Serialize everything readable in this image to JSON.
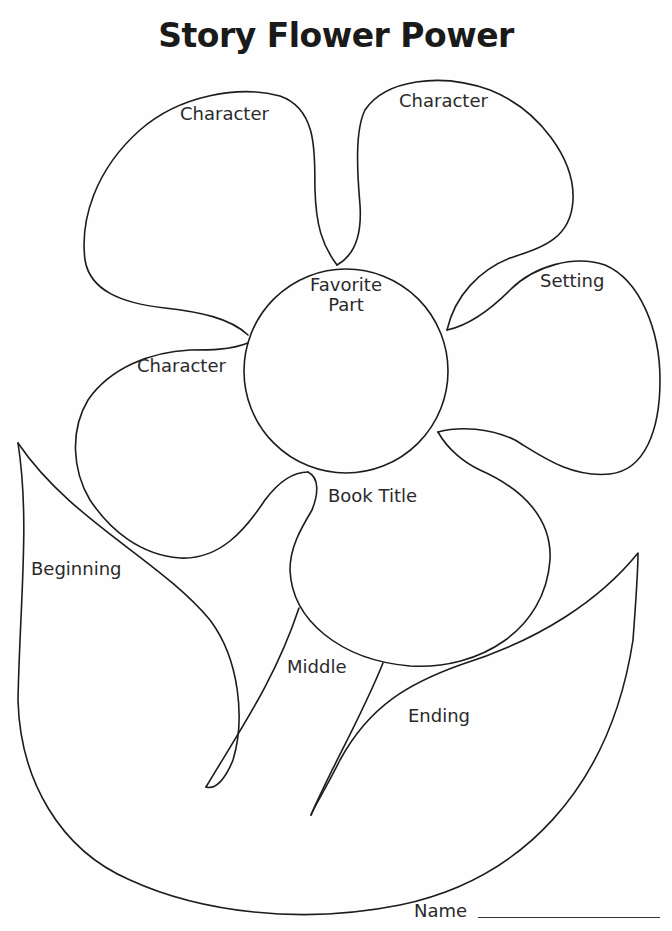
{
  "title": "Story Flower Power",
  "flower": {
    "center": {
      "label_line1": "Favorite",
      "label_line2": "Part"
    },
    "petals": [
      {
        "id": "petal-top-left",
        "label": "Character"
      },
      {
        "id": "petal-top-right",
        "label": "Character"
      },
      {
        "id": "petal-right",
        "label": "Setting"
      },
      {
        "id": "petal-left",
        "label": "Character"
      },
      {
        "id": "petal-bottom",
        "label": "Book Title"
      }
    ],
    "leaves": [
      {
        "id": "leaf-left",
        "label": "Beginning"
      },
      {
        "id": "stem",
        "label": "Middle"
      },
      {
        "id": "leaf-right",
        "label": "Ending"
      }
    ]
  },
  "footer": {
    "name_label": "Name"
  },
  "colors": {
    "ink": "#1c1c1c",
    "paper": "#fefefe"
  }
}
